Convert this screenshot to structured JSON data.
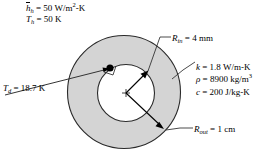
{
  "figure": {
    "geometry": {
      "outer_circle": {
        "cx": 124,
        "cy": 92,
        "r": 57
      },
      "inner_circle": {
        "cx": 126,
        "cy": 93,
        "r": 29
      },
      "annulus_fill": "#d4d4d4",
      "inner_fill": "#ffffff",
      "stroke": "#000000",
      "point_marker": {
        "x": 110,
        "y": 68,
        "label": "surface-point-d"
      }
    },
    "labels": {
      "h_bar": {
        "symbol": "h",
        "subscript": "h",
        "equals": "=",
        "value": "50",
        "unit_main": "W/m",
        "unit_exp": "2",
        "unit_tail": "-K",
        "full": "h_h = 50 W/m2-K"
      },
      "t_h": {
        "symbol": "T",
        "subscript": "h",
        "equals": "=",
        "value": "50",
        "unit": "K",
        "full": "T_h = 50 K"
      },
      "r_in": {
        "symbol": "R",
        "subscript": "in",
        "equals": "=",
        "value": "4",
        "unit": "mm",
        "full": "R_in = 4 mm"
      },
      "t_d": {
        "symbol": "T",
        "subscript": "d",
        "equals": "=",
        "value": "18.7",
        "unit": "K",
        "full": "T_d = 18.7 K"
      },
      "k": {
        "symbol": "k",
        "equals": "=",
        "value": "1.8",
        "unit": "W/m-K",
        "full": "k = 1.8 W/m-K"
      },
      "rho": {
        "symbol": "ρ",
        "equals": "=",
        "value": "8900",
        "unit_main": "kg/m",
        "unit_exp": "3",
        "full": "rho = 8900 kg/m3"
      },
      "c": {
        "symbol": "c",
        "equals": "=",
        "value": "200",
        "unit": "J/kg-K",
        "full": "c = 200 J/kg-K"
      },
      "r_out": {
        "symbol": "R",
        "subscript": "out",
        "equals": "=",
        "value": "1",
        "unit": "cm",
        "full": "R_out = 1 cm"
      }
    }
  }
}
